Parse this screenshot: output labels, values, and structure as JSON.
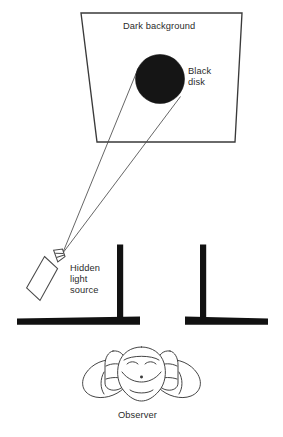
{
  "figure": {
    "background_color": "#ffffff",
    "ink_color": "#231f20",
    "labels": {
      "dark_background": "Dark background",
      "black_disk_line1": "Black",
      "black_disk_line2": "disk",
      "hidden_light_line1": "Hidden",
      "hidden_light_line2": "light",
      "hidden_light_line3": "source",
      "observer": "Observer"
    },
    "elements": {
      "screen_name": "dark-background-screen",
      "disk_name": "black-disk",
      "disk_fill": "#1a1a1a",
      "light_source_name": "hidden-light-source-box",
      "ray_name": "light-ray",
      "left_post_name": "left-occluder-post",
      "right_post_name": "right-occluder-post",
      "baseline_left_name": "left-baseline",
      "baseline_right_name": "right-baseline",
      "observer_name": "observer-figure"
    }
  }
}
